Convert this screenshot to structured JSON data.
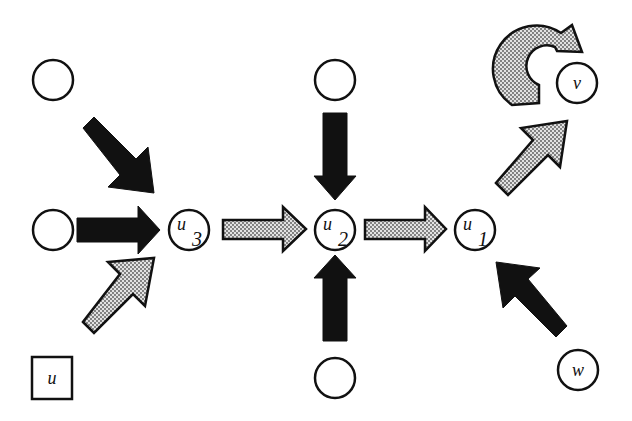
{
  "diagram": {
    "type": "graph-flow",
    "colors": {
      "background": "#ffffff",
      "stroke": "#111111",
      "dark_arrow": "#111111",
      "stippled_arrow_fill": "#bdbdbd",
      "node_fill": "#ffffff"
    },
    "nodes": [
      {
        "id": "empty-top-left",
        "label": "",
        "shape": "circle",
        "x": 53,
        "y": 80
      },
      {
        "id": "empty-mid-left",
        "label": "",
        "shape": "circle",
        "x": 53,
        "y": 230
      },
      {
        "id": "empty-top-center",
        "label": "",
        "shape": "circle",
        "x": 335,
        "y": 80
      },
      {
        "id": "empty-bottom-center",
        "label": "",
        "shape": "circle",
        "x": 335,
        "y": 378
      },
      {
        "id": "u3",
        "label": "u",
        "subscript": "3",
        "shape": "circle",
        "x": 189,
        "y": 230
      },
      {
        "id": "u2",
        "label": "u",
        "subscript": "2",
        "shape": "circle",
        "x": 335,
        "y": 230
      },
      {
        "id": "u1",
        "label": "u",
        "subscript": "1",
        "shape": "circle",
        "x": 475,
        "y": 230
      },
      {
        "id": "v",
        "label": "v",
        "subscript": "",
        "shape": "circle",
        "x": 577,
        "y": 83
      },
      {
        "id": "w",
        "label": "w",
        "subscript": "",
        "shape": "circle",
        "x": 578,
        "y": 370
      },
      {
        "id": "u",
        "label": "u",
        "subscript": "",
        "shape": "square",
        "x": 52,
        "y": 378
      }
    ],
    "edges": [
      {
        "from": "empty-top-left",
        "to": "u3",
        "style": "dark"
      },
      {
        "from": "empty-mid-left",
        "to": "u3",
        "style": "dark"
      },
      {
        "from": "u",
        "to": "u3",
        "style": "stippled"
      },
      {
        "from": "u3",
        "to": "u2",
        "style": "stippled"
      },
      {
        "from": "empty-top-center",
        "to": "u2",
        "style": "dark"
      },
      {
        "from": "empty-bottom-center",
        "to": "u2",
        "style": "dark"
      },
      {
        "from": "u2",
        "to": "u1",
        "style": "stippled"
      },
      {
        "from": "u1",
        "to": "v",
        "style": "stippled"
      },
      {
        "from": "w",
        "to": "u1",
        "style": "dark"
      },
      {
        "from": "v",
        "to": "v",
        "style": "stippled",
        "kind": "self-loop"
      }
    ]
  }
}
